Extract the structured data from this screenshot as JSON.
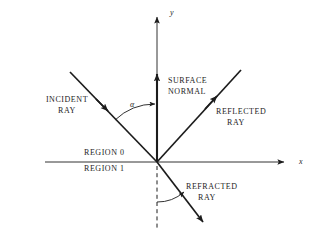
{
  "figure": {
    "domain": "ray-optics-diagram",
    "background_color": "#ffffff",
    "stroke_color": "#1c1c1c",
    "text_color": "#1c1c1c",
    "origin": {
      "x": 157,
      "y": 162
    }
  },
  "axes": {
    "x_label": "x",
    "y_label": "y",
    "x_axis": {
      "x1": 45,
      "y1": 162,
      "x2": 288,
      "y2": 162
    },
    "y_axis": {
      "x1": 157,
      "y1": 162,
      "x2": 157,
      "y2": 13
    }
  },
  "labels": {
    "incident_ray_line1": "INCIDENT",
    "incident_ray_line2": "RAY",
    "reflected_ray_line1": "REFLECTED",
    "reflected_ray_line2": "RAY",
    "refracted_ray_line1": "REFRACTED",
    "refracted_ray_line2": "RAY",
    "surface_normal_line1": "SURFACE",
    "surface_normal_line2": "NORMAL",
    "region_upper": "REGION 0",
    "region_lower": "REGION 1",
    "angle_alpha": "α"
  },
  "rays": {
    "incident": {
      "from": {
        "x": 70,
        "y": 72
      },
      "to": {
        "x": 157,
        "y": 162
      },
      "arrow_at": {
        "x": 107,
        "y": 110
      }
    },
    "reflected": {
      "from": {
        "x": 157,
        "y": 162
      },
      "to": {
        "x": 241,
        "y": 70
      },
      "arrow_at": {
        "x": 218,
        "y": 95
      }
    },
    "refracted": {
      "from": {
        "x": 157,
        "y": 162
      },
      "to": {
        "x": 206,
        "y": 226
      }
    },
    "surface_normal": {
      "from": {
        "x": 157,
        "y": 162
      },
      "to": {
        "x": 157,
        "y": 70
      }
    },
    "normal_extension_dashed": {
      "from": {
        "x": 157,
        "y": 166
      },
      "to": {
        "x": 157,
        "y": 228
      }
    }
  },
  "angles": {
    "incidence_arc_label": "α",
    "refraction_arc": {
      "center": {
        "x": 157,
        "y": 162
      },
      "radius": 40
    },
    "incidence_arc": {
      "center": {
        "x": 157,
        "y": 162
      },
      "radius": 58
    }
  }
}
